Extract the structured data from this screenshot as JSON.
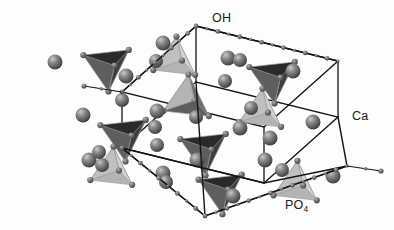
{
  "figure": {
    "type": "crystal-structure-diagram",
    "background_color": "#fdfdfd",
    "labels": [
      {
        "id": "oh",
        "text": "OH",
        "sub": "",
        "x": 212,
        "y": 22,
        "name": "label-oh"
      },
      {
        "id": "ca",
        "text": "Ca",
        "sub": "",
        "x": 352,
        "y": 120,
        "name": "label-ca"
      },
      {
        "id": "po4",
        "text": "PO",
        "sub": "4",
        "x": 285,
        "y": 209,
        "name": "label-po4"
      }
    ],
    "legend_meaning": {
      "OH": "hydroxyl chains along the c-axis edges",
      "Ca": "calcium atoms, large shaded spheres",
      "PO4": "phosphate tetrahedra"
    },
    "colors": {
      "cell_edge": "#141414",
      "sphere_ca_fill": "#7b7b7b",
      "sphere_ca_dark": "#4a4a4a",
      "sphere_ca_highlight": "#c9c9c9",
      "sphere_small": "#6e6e6e",
      "tetra_dark": "#2a2a2a",
      "tetra_mid": "#5e5e5e",
      "tetra_light": "#b4b4b4",
      "tetra_pale": "#d2d2d2",
      "tetra_edge": "#9a9a9a",
      "label_color": "#1b1b1b"
    },
    "cell": {
      "description": "Monoclinic/hexagonal parallelepiped outline drawn in projection",
      "top_face": [
        [
          122,
          92
        ],
        [
          196,
          26
        ],
        [
          338,
          61
        ],
        [
          264,
          127
        ]
      ],
      "bottom_face": [
        [
          122,
          148
        ],
        [
          196,
          82
        ],
        [
          338,
          117
        ],
        [
          264,
          183
        ]
      ],
      "verticals": [
        [
          [
            122,
            92
          ],
          [
            122,
            148
          ]
        ],
        [
          [
            196,
            26
          ],
          [
            196,
            82
          ]
        ],
        [
          [
            338,
            61
          ],
          [
            338,
            117
          ]
        ],
        [
          [
            264,
            127
          ],
          [
            264,
            183
          ]
        ]
      ],
      "outer_front": [
        [
          122,
          148
        ],
        [
          205,
          216
        ],
        [
          347,
          166
        ],
        [
          264,
          183
        ]
      ]
    },
    "oh_chains": [
      {
        "name": "oh-chain-top-left",
        "from": [
          122,
          92
        ],
        "to": [
          196,
          26
        ],
        "beads": 9
      },
      {
        "name": "oh-chain-top-right",
        "from": [
          196,
          26
        ],
        "to": [
          338,
          61
        ],
        "beads": 13
      },
      {
        "name": "oh-chain-bottom-left",
        "from": [
          122,
          148
        ],
        "to": [
          205,
          216
        ],
        "beads": 9
      },
      {
        "name": "oh-chain-bottom-right",
        "from": [
          205,
          216
        ],
        "to": [
          347,
          166
        ],
        "beads": 13
      }
    ],
    "oh_stubs": [
      {
        "name": "oh-stub-left",
        "x": 122,
        "y": 92,
        "dx": -38,
        "dy": -6
      },
      {
        "name": "oh-stub-right",
        "x": 347,
        "y": 166,
        "dx": 34,
        "dy": 5
      }
    ],
    "tetrahedra": [
      {
        "name": "tetra-1",
        "cx": 108,
        "cy": 66,
        "size": 1.0,
        "orient": "down",
        "shade": "dark"
      },
      {
        "name": "tetra-2",
        "cx": 176,
        "cy": 60,
        "size": 0.92,
        "orient": "up",
        "shade": "light"
      },
      {
        "name": "tetra-3",
        "cx": 188,
        "cy": 100,
        "size": 1.0,
        "orient": "up",
        "shade": "mid"
      },
      {
        "name": "tetra-4",
        "cx": 274,
        "cy": 78,
        "size": 1.0,
        "orient": "down",
        "shade": "dark"
      },
      {
        "name": "tetra-5",
        "cx": 262,
        "cy": 112,
        "size": 0.92,
        "orient": "up",
        "shade": "light"
      },
      {
        "name": "tetra-6",
        "cx": 125,
        "cy": 136,
        "size": 1.0,
        "orient": "down",
        "shade": "dark"
      },
      {
        "name": "tetra-7",
        "cx": 113,
        "cy": 170,
        "size": 0.92,
        "orient": "up",
        "shade": "light"
      },
      {
        "name": "tetra-8",
        "cx": 205,
        "cy": 150,
        "size": 1.0,
        "orient": "down",
        "shade": "dark"
      },
      {
        "name": "tetra-9",
        "cx": 222,
        "cy": 190,
        "size": 0.95,
        "orient": "down",
        "shade": "dark"
      },
      {
        "name": "tetra-10",
        "cx": 297,
        "cy": 185,
        "size": 0.95,
        "orient": "up",
        "shade": "light"
      }
    ],
    "ca_atoms": [
      {
        "x": 55,
        "y": 62,
        "r": 7.5
      },
      {
        "x": 163,
        "y": 43,
        "r": 7.5
      },
      {
        "x": 122,
        "y": 100,
        "r": 7.0
      },
      {
        "x": 156,
        "y": 61,
        "r": 7.0
      },
      {
        "x": 126,
        "y": 76,
        "r": 7.5
      },
      {
        "x": 228,
        "y": 58,
        "r": 7.5
      },
      {
        "x": 240,
        "y": 60,
        "r": 7.0
      },
      {
        "x": 225,
        "y": 81,
        "r": 7.0
      },
      {
        "x": 293,
        "y": 71,
        "r": 7.5
      },
      {
        "x": 157,
        "y": 111,
        "r": 7.5
      },
      {
        "x": 83,
        "y": 115,
        "r": 7.5
      },
      {
        "x": 155,
        "y": 127,
        "r": 7.0
      },
      {
        "x": 196,
        "y": 117,
        "r": 7.0
      },
      {
        "x": 240,
        "y": 128,
        "r": 7.5
      },
      {
        "x": 313,
        "y": 122,
        "r": 7.5
      },
      {
        "x": 251,
        "y": 108,
        "r": 7.0
      },
      {
        "x": 270,
        "y": 138,
        "r": 7.5
      },
      {
        "x": 157,
        "y": 145,
        "r": 7.0
      },
      {
        "x": 197,
        "y": 160,
        "r": 7.5
      },
      {
        "x": 89,
        "y": 160,
        "r": 7.5
      },
      {
        "x": 102,
        "y": 165,
        "r": 7.0
      },
      {
        "x": 265,
        "y": 160,
        "r": 7.5
      },
      {
        "x": 333,
        "y": 176,
        "r": 7.5
      },
      {
        "x": 163,
        "y": 173,
        "r": 7.5
      },
      {
        "x": 166,
        "y": 182,
        "r": 7.0
      },
      {
        "x": 233,
        "y": 196,
        "r": 7.5
      },
      {
        "x": 282,
        "y": 170,
        "r": 7.0
      },
      {
        "x": 99,
        "y": 152,
        "r": 7.0
      }
    ]
  }
}
